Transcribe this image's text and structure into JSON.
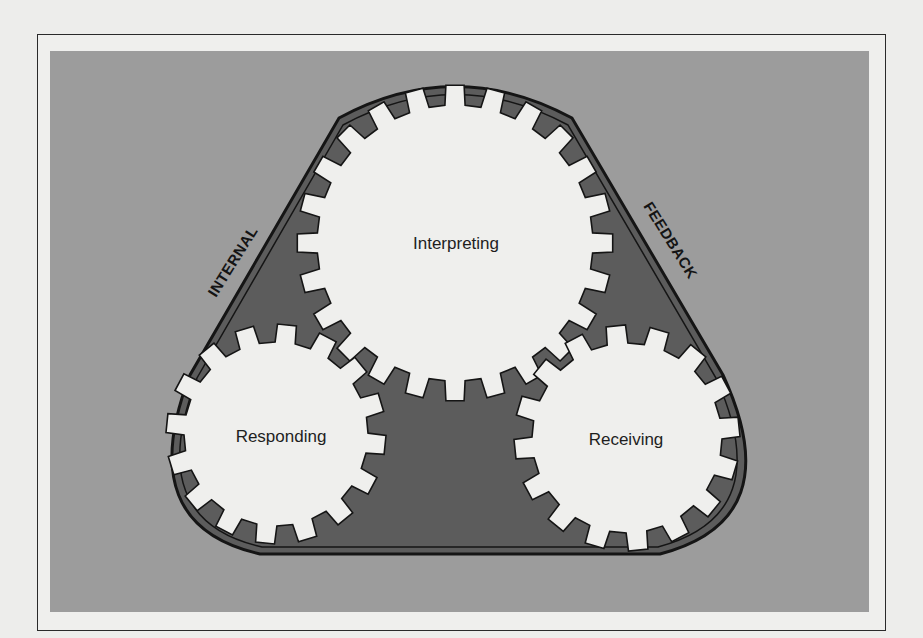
{
  "diagram": {
    "gears": [
      {
        "id": "interpreting",
        "label": "Interpreting",
        "cx": 455,
        "cy": 243,
        "r_outer": 158,
        "r_root": 138,
        "teeth": 24
      },
      {
        "id": "responding",
        "label": "Responding",
        "cx": 276,
        "cy": 434,
        "r_outer": 110,
        "r_root": 92,
        "teeth": 16
      },
      {
        "id": "receiving",
        "label": "Receiving",
        "cx": 627,
        "cy": 438,
        "r_outer": 113,
        "r_root": 95,
        "teeth": 16
      }
    ],
    "belt": {
      "labels": [
        {
          "id": "internal",
          "text": "INTERNAL"
        },
        {
          "id": "feedback",
          "text": "FEEDBACK"
        }
      ]
    },
    "colors": {
      "page": "#ededeb",
      "panel": "#9c9c9c",
      "belt_fill": "#5c5c5c",
      "gear_fill": "#efefed",
      "outline": "#151515"
    }
  }
}
